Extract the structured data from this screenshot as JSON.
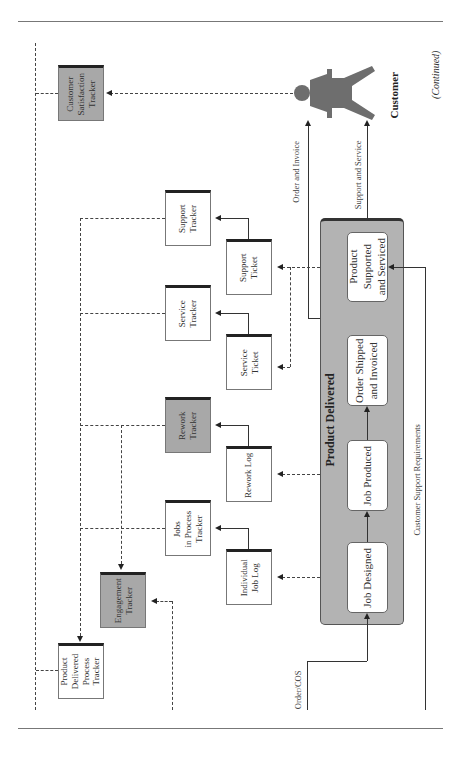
{
  "figure": {
    "continued_label": "(Continued)",
    "group_title": "Product Delivered",
    "actor": {
      "label": "Customer",
      "icon": "person-icon"
    },
    "processes": [
      {
        "id": "job-designed",
        "label": "Job Designed"
      },
      {
        "id": "job-produced",
        "label": "Job Produced"
      },
      {
        "id": "order-shipped",
        "label": "Order Shipped\nand Invoiced"
      },
      {
        "id": "product-supported",
        "label": "Product\nSupported\nand Serviced"
      }
    ],
    "documents": [
      {
        "id": "customer-satisfaction-tracker",
        "label": "Customer\nSatisfaction\nTracker",
        "shaded": true
      },
      {
        "id": "support-tracker",
        "label": "Support\nTracker",
        "shaded": false
      },
      {
        "id": "support-ticket",
        "label": "Support\nTicket",
        "shaded": false
      },
      {
        "id": "service-tracker",
        "label": "Service\nTracker",
        "shaded": false
      },
      {
        "id": "service-ticket",
        "label": "Service\nTicket",
        "shaded": false
      },
      {
        "id": "rework-tracker",
        "label": "Rework\nTracker",
        "shaded": true
      },
      {
        "id": "rework-log",
        "label": "Rework Log",
        "shaded": false
      },
      {
        "id": "jobs-in-process-tracker",
        "label": "Jobs\nin Process\nTracker",
        "shaded": false
      },
      {
        "id": "individual-job-log",
        "label": "Individual\nJob Log",
        "shaded": false
      },
      {
        "id": "engagement-tracker",
        "label": "Engagement\nTracker",
        "shaded": true
      },
      {
        "id": "product-delivered-process-tracker",
        "label": "Product\nDelivered\nProcess\nTracker",
        "shaded": false
      }
    ],
    "flow_labels": {
      "order_and_invoice": "Order and Invoice",
      "support_and_service": "Support and Service",
      "customer_support_requirements": "Customer Support Requirements",
      "order_cos": "Order/COS"
    },
    "colors": {
      "group_fill": "#b3b3b3",
      "shaded_doc": "#a8a8a8",
      "actor": "#6e6e6e",
      "line": "#333333"
    }
  }
}
